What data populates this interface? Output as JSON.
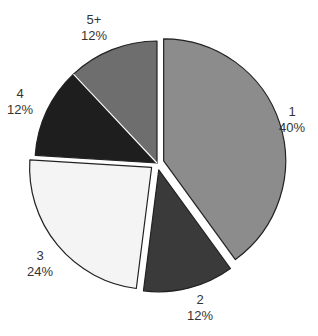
{
  "chart_data": {
    "type": "pie",
    "title": "",
    "categories": [
      "1",
      "2",
      "3",
      "4",
      "5+"
    ],
    "values": [
      40,
      12,
      24,
      12,
      12
    ],
    "unit": "%",
    "labels": [
      {
        "name": "1",
        "pct": "40%"
      },
      {
        "name": "2",
        "pct": "12%"
      },
      {
        "name": "3",
        "pct": "24%"
      },
      {
        "name": "4",
        "pct": "12%"
      },
      {
        "name": "5+",
        "pct": "12%"
      }
    ],
    "colors": [
      "#8c8c8c",
      "#3a3a3a",
      "#f4f4f4",
      "#1e1e1e",
      "#6e6e6e"
    ],
    "exploded": [
      true,
      true,
      true,
      false,
      false
    ],
    "start_angle_deg": 0,
    "direction": "clockwise",
    "legend": "none"
  }
}
